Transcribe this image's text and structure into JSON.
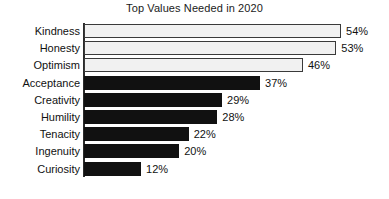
{
  "chart_data": {
    "type": "bar",
    "orientation": "horizontal",
    "title": "Top Values Needed in 2020",
    "xlabel": "",
    "ylabel": "",
    "xlim": [
      0,
      54
    ],
    "grid": false,
    "legend": false,
    "value_suffix": "%",
    "categories": [
      "Kindness",
      "Honesty",
      "Optimism",
      "Acceptance",
      "Creativity",
      "Humility",
      "Tenacity",
      "Ingenuity",
      "Curiosity"
    ],
    "values": [
      54,
      53,
      46,
      37,
      29,
      28,
      22,
      20,
      12
    ],
    "value_labels": [
      "54%",
      "53%",
      "46%",
      "37%",
      "29%",
      "28%",
      "22%",
      "20%",
      "12%"
    ],
    "bar_styles": [
      "light",
      "light",
      "light",
      "dark",
      "dark",
      "dark",
      "dark",
      "dark",
      "dark"
    ],
    "colors": {
      "bar_dark": "#111111",
      "bar_light_fill": "#f1f1f1",
      "bar_light_border": "#3a3a3a",
      "axis": "#2b2b2b",
      "text": "#111111",
      "background": "#ffffff"
    }
  }
}
